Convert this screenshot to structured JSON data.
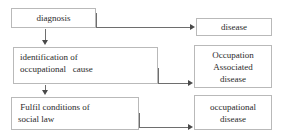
{
  "diagram": {
    "type": "flowchart",
    "title": "",
    "colors": {
      "box_border": "#b9b9b9",
      "connector": "#6e6e6e",
      "arrowhead": "#4a4a4a",
      "text": "#2b2b2b",
      "background": "#ffffff"
    },
    "nodes": {
      "diagnosis": {
        "label": "diagnosis",
        "lines": [
          "diagnosis"
        ]
      },
      "identification": {
        "label": "identification of occupational cause",
        "lines": [
          "identification of",
          "occupational   cause"
        ]
      },
      "fulfil": {
        "label": "Fulfil conditions of social law",
        "lines": [
          " Fulfil conditions of",
          "social law"
        ]
      },
      "disease": {
        "label": "disease",
        "lines": [
          "disease"
        ]
      },
      "occupation_associated": {
        "label": "Occupation Associated disease",
        "lines": [
          "Occupation",
          "Associated",
          "disease"
        ]
      },
      "occupational_disease": {
        "label": "occupational disease",
        "lines": [
          "occupational",
          "disease"
        ]
      }
    },
    "edges": [
      {
        "from": "diagnosis",
        "to": "disease",
        "style": "elbow-right",
        "arrow": "right"
      },
      {
        "from": "diagnosis",
        "to": "identification",
        "style": "straight-down",
        "arrow": "down"
      },
      {
        "from": "identification",
        "to": "occupation_associated",
        "style": "elbow-right",
        "arrow": "right"
      },
      {
        "from": "identification",
        "to": "fulfil",
        "style": "straight-down",
        "arrow": "down"
      },
      {
        "from": "fulfil",
        "to": "occupational_disease",
        "style": "elbow-right",
        "arrow": "right"
      }
    ]
  }
}
